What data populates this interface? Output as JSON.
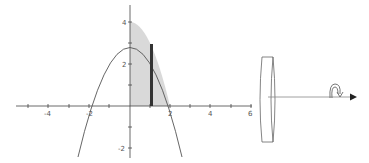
{
  "figure": {
    "graph": {
      "x_tick_labels": [
        "-4",
        "-2",
        "2",
        "4",
        "6"
      ],
      "y_tick_labels": [
        "4",
        "2",
        "-2"
      ],
      "curve": "y = 4 - x^2",
      "shaded_region": {
        "x_from": 0,
        "x_to": 2,
        "fill": "#d9d9d9"
      },
      "strip": {
        "x": 1.1,
        "color": "#333333"
      }
    },
    "solid": {
      "shape": "disk",
      "axis": "x-axis",
      "rotation_arrow": "curved-rotation-arrow"
    }
  }
}
